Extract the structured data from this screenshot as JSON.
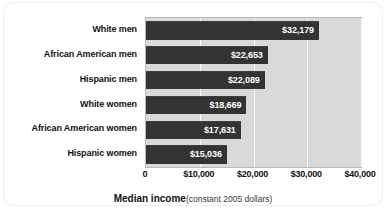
{
  "chart_data": {
    "type": "bar",
    "orientation": "horizontal",
    "title": "",
    "xlabel": "Median income (constant 2005 dollars)",
    "xlabel_main": "Median income",
    "xlabel_sub": "(constant 2005 dollars)",
    "ylabel": "",
    "xlim": [
      0,
      40000
    ],
    "xticks": [
      0,
      10000,
      20000,
      30000,
      40000
    ],
    "xtick_labels": [
      "0",
      "$10,000",
      "$20,000",
      "$30,000",
      "$40,000"
    ],
    "grid": true,
    "grid_axis": "x",
    "legend": "none",
    "categories": [
      "White men",
      "African American men",
      "Hispanic men",
      "White women",
      "African American women",
      "Hispanic women"
    ],
    "values": [
      32179,
      22653,
      22089,
      18669,
      17631,
      15036
    ],
    "value_labels": [
      "$32,179",
      "$22,653",
      "$22,089",
      "$18,669",
      "$17,631",
      "$15,036"
    ],
    "bar_color": "#333333",
    "plot_background": "#d9d9d9",
    "gridline_color": "#fbfbfb",
    "value_label_color": "#ffffff",
    "category_label_color": "#111111"
  }
}
